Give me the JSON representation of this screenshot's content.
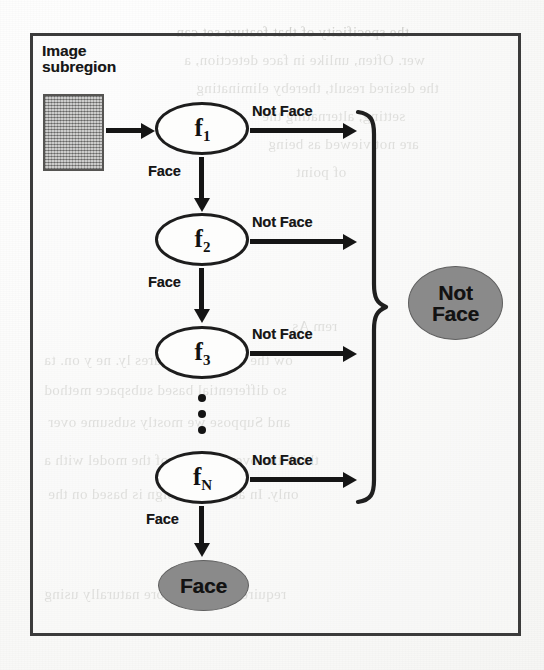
{
  "figure": {
    "caption_absent": true,
    "input_label": "Image\nsubregion",
    "input_label_line1": "Image",
    "input_label_line2": "subregion",
    "stages": [
      {
        "id": "f1",
        "base": "f",
        "sub": "1",
        "reject_label": "Not Face",
        "accept_label": "Face"
      },
      {
        "id": "f2",
        "base": "f",
        "sub": "2",
        "reject_label": "Not Face",
        "accept_label": "Face"
      },
      {
        "id": "f3",
        "base": "f",
        "sub": "3",
        "reject_label": "Not Face",
        "accept_label": ""
      },
      {
        "id": "fN",
        "base": "f",
        "sub": "N",
        "reject_label": "Not Face",
        "accept_label": "Face"
      }
    ],
    "terminals": {
      "reject": {
        "line1": "Not",
        "line2": "Face",
        "fill": "#8a8a8a"
      },
      "accept": {
        "line1": "Face",
        "fill": "#8a8a8a"
      }
    },
    "ellipsis": "⋮",
    "colors": {
      "ink": "#151515",
      "frame": "#3b3b3b",
      "stage_fill": "#fdfdfc",
      "terminal_fill": "#8a8a8a",
      "subregion_fill": "#a6a6a4",
      "paper": "#f7f7f5"
    }
  },
  "background_ghost_text": {
    "note": "Faint illegible bleed-through text from the reverse page",
    "lines": [
      "the specificity of that feature set can",
      "wer. Often, unlike in face detection, a",
      "the desired result, thereby eliminating",
      "setting, alternating the",
      "are not viewed as being",
      "of point",
      "rem As",
      "ow the structure features ly. ne y on. ta",
      "so differential based subspace method",
      "and Suppose we mostly subsume over",
      "think the over-learning of the model with a",
      "only. In addition, a sign is based on the",
      "require that it be more naturally using"
    ]
  }
}
